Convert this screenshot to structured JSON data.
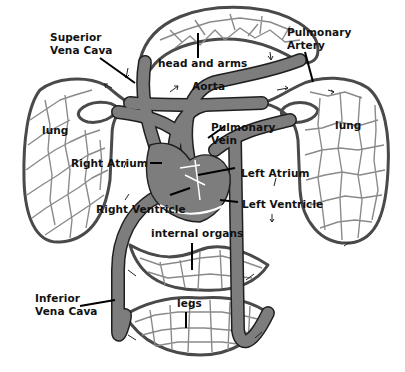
{
  "diagram": {
    "colors": {
      "vessel": "#7d7d7d",
      "outline": "#1f1f1f",
      "background": "#ffffff",
      "text": "#111111"
    },
    "labels": {
      "superior_vena_cava": "Superior\nVena Cava",
      "pulmonary_artery": "Pulmonary\nArtery",
      "head_and_arms": "head and arms",
      "aorta": "Aorta",
      "lung_left": "lung",
      "lung_right": "lung",
      "pulmonary_vein": "Pulmonary\nVein",
      "right_atrium": "Right Atrium",
      "left_atrium": "Left Atrium",
      "right_ventricle": "Right Ventricle",
      "left_ventricle": "Left Ventricle",
      "internal_organs": "internal organs",
      "inferior_vena_cava": "Inferior\nVena Cava",
      "legs": "legs"
    }
  }
}
